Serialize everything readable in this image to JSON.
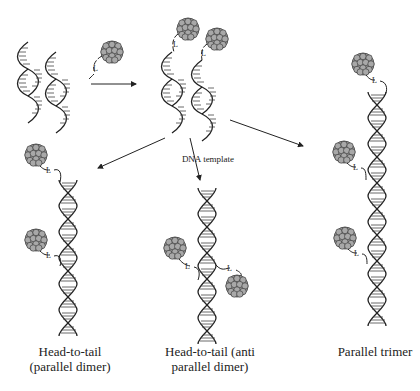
{
  "diagram": {
    "labels": {
      "linker": "L",
      "dna_template": "DNA template"
    },
    "captions": {
      "head_to_tail_parallel_line1": "Head-to-tail",
      "head_to_tail_parallel_line2": "(parallel dimer)",
      "head_to_tail_anti_line1": "Head-to-tail (anti",
      "head_to_tail_anti_line2": "parallel dimer)",
      "parallel_trimer": "Parallel trimer"
    },
    "colors": {
      "line": "#222222",
      "nanoparticle_fill": "#9a9a9a",
      "nanoparticle_stroke": "#333333"
    },
    "nodes": [
      {
        "id": "ssdna-strands",
        "desc": "two single DNA strands"
      },
      {
        "id": "np-linker",
        "desc": "nanoparticle with linker L"
      },
      {
        "id": "np-dna-conjugates",
        "desc": "two nanoparticle-DNA conjugates"
      },
      {
        "id": "head-to-tail-parallel",
        "desc": "Head-to-tail (parallel dimer)"
      },
      {
        "id": "head-to-tail-anti",
        "desc": "Head-to-tail (anti parallel dimer)"
      },
      {
        "id": "parallel-trimer",
        "desc": "Parallel trimer"
      }
    ],
    "edges": [
      {
        "from": "ssdna-strands",
        "to": "np-dna-conjugates"
      },
      {
        "from": "np-dna-conjugates",
        "to": "head-to-tail-parallel",
        "label": ""
      },
      {
        "from": "np-dna-conjugates",
        "to": "head-to-tail-anti",
        "label": "DNA template"
      },
      {
        "from": "np-dna-conjugates",
        "to": "parallel-trimer",
        "label": ""
      }
    ]
  }
}
